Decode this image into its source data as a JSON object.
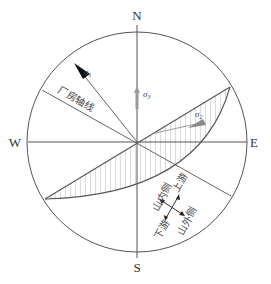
{
  "diagram": {
    "type": "stereographic-projection",
    "compass": {
      "north": "N",
      "south": "S",
      "east": "E",
      "west": "W"
    },
    "axis_label": "厂房轴线",
    "stress": {
      "sigma1": {
        "symbol": "σ",
        "subscript": "1",
        "style": "black-arrow"
      },
      "sigma2": {
        "symbol": "σ",
        "subscript": "2",
        "style": "gray-arrow"
      },
      "sigma3": {
        "symbol": "σ",
        "subscript": "3",
        "style": "gray-arrow"
      }
    },
    "orientation_cross": {
      "up_right": "上游",
      "up_left": "山内侧",
      "down_left": "下游",
      "down_right": "山外侧"
    },
    "colors": {
      "line": "#555555",
      "hatch": "#8a8a8a",
      "sigma1": "#111111",
      "sigma_gray": "#9a9a9a",
      "background": "#ffffff"
    }
  }
}
